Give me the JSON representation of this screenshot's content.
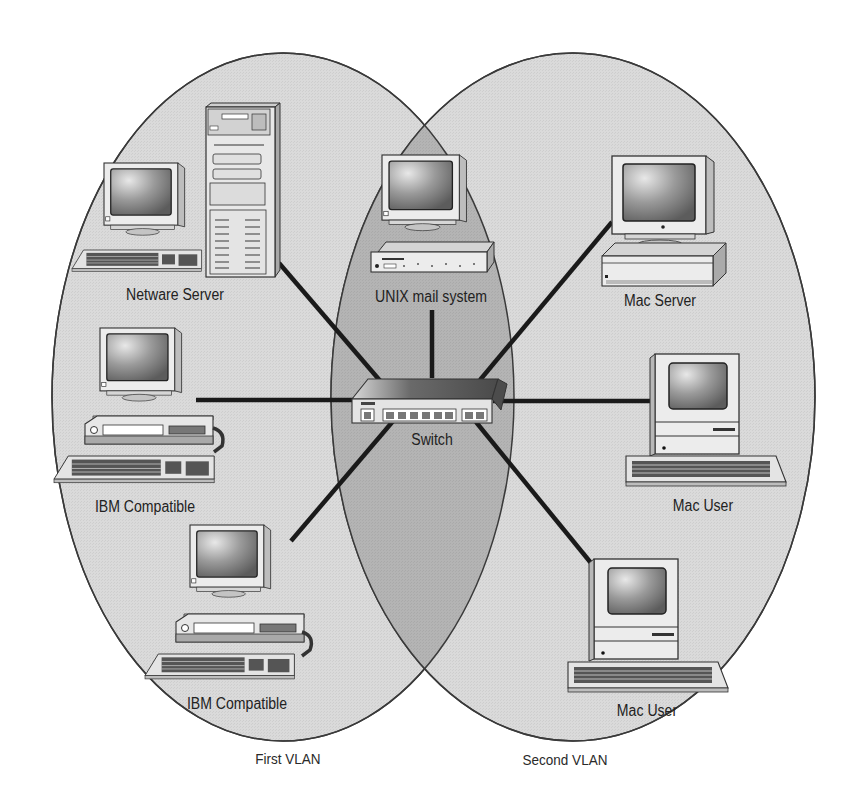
{
  "diagram": {
    "title": "",
    "vlans": [
      {
        "id": "first",
        "label": "First VLAN",
        "fill": "#d9d9d9"
      },
      {
        "id": "second",
        "label": "Second VLAN",
        "fill": "#dadada"
      }
    ],
    "overlap_fill": "#b3b3b3",
    "line_color": "#1a1a1a",
    "hub": {
      "label": "Switch",
      "icon": "network-switch-icon"
    },
    "nodes": [
      {
        "id": "netware-server",
        "label": "Netware Server",
        "icon": "tower-server-with-monitor-icon",
        "vlan": "First VLAN"
      },
      {
        "id": "ibm-compatible-1",
        "label": "IBM Compatible",
        "icon": "desktop-pc-icon",
        "vlan": "First VLAN"
      },
      {
        "id": "ibm-compatible-2",
        "label": "IBM Compatible",
        "icon": "desktop-pc-icon",
        "vlan": "First VLAN"
      },
      {
        "id": "unix-mail-system",
        "label": "UNIX mail system",
        "icon": "workstation-icon",
        "vlan": "Both"
      },
      {
        "id": "mac-server",
        "label": "Mac Server",
        "icon": "mac-server-icon",
        "vlan": "Second VLAN"
      },
      {
        "id": "mac-user-1",
        "label": "Mac User",
        "icon": "compact-mac-icon",
        "vlan": "Second VLAN"
      },
      {
        "id": "mac-user-2",
        "label": "Mac User",
        "icon": "compact-mac-icon",
        "vlan": "Second VLAN"
      }
    ],
    "edges": [
      {
        "from": "netware-server",
        "to": "switch"
      },
      {
        "from": "ibm-compatible-1",
        "to": "switch"
      },
      {
        "from": "ibm-compatible-2",
        "to": "switch"
      },
      {
        "from": "unix-mail-system",
        "to": "switch"
      },
      {
        "from": "mac-server",
        "to": "switch"
      },
      {
        "from": "mac-user-1",
        "to": "switch"
      },
      {
        "from": "mac-user-2",
        "to": "switch"
      }
    ]
  }
}
